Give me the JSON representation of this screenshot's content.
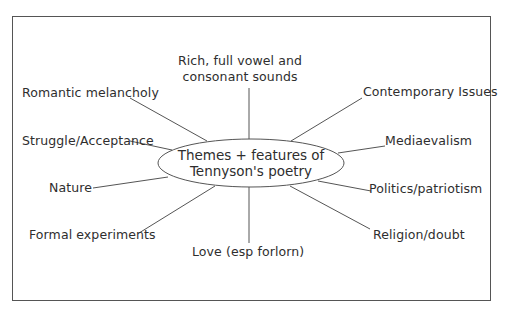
{
  "diagram": {
    "type": "mind-map",
    "center": {
      "line1": "Themes + features of",
      "line2": "Tennyson's poetry"
    },
    "branches": [
      {
        "id": "sounds",
        "line1": "Rich, full vowel and",
        "line2": "consonant sounds"
      },
      {
        "id": "romantic",
        "label": "Romantic melancholy"
      },
      {
        "id": "struggle",
        "label": "Struggle/Acceptance"
      },
      {
        "id": "nature",
        "label": "Nature"
      },
      {
        "id": "formal",
        "label": "Formal experiments"
      },
      {
        "id": "love",
        "label": "Love (esp forlorn)"
      },
      {
        "id": "religion",
        "label": "Religion/doubt"
      },
      {
        "id": "politics",
        "label": "Politics/patriotism"
      },
      {
        "id": "mediaevalism",
        "label": "Mediaevalism"
      },
      {
        "id": "contemporary",
        "label": "Contemporary Issues"
      }
    ],
    "colors": {
      "line": "#555555",
      "text": "#2e2e2e",
      "background": "#ffffff"
    }
  }
}
